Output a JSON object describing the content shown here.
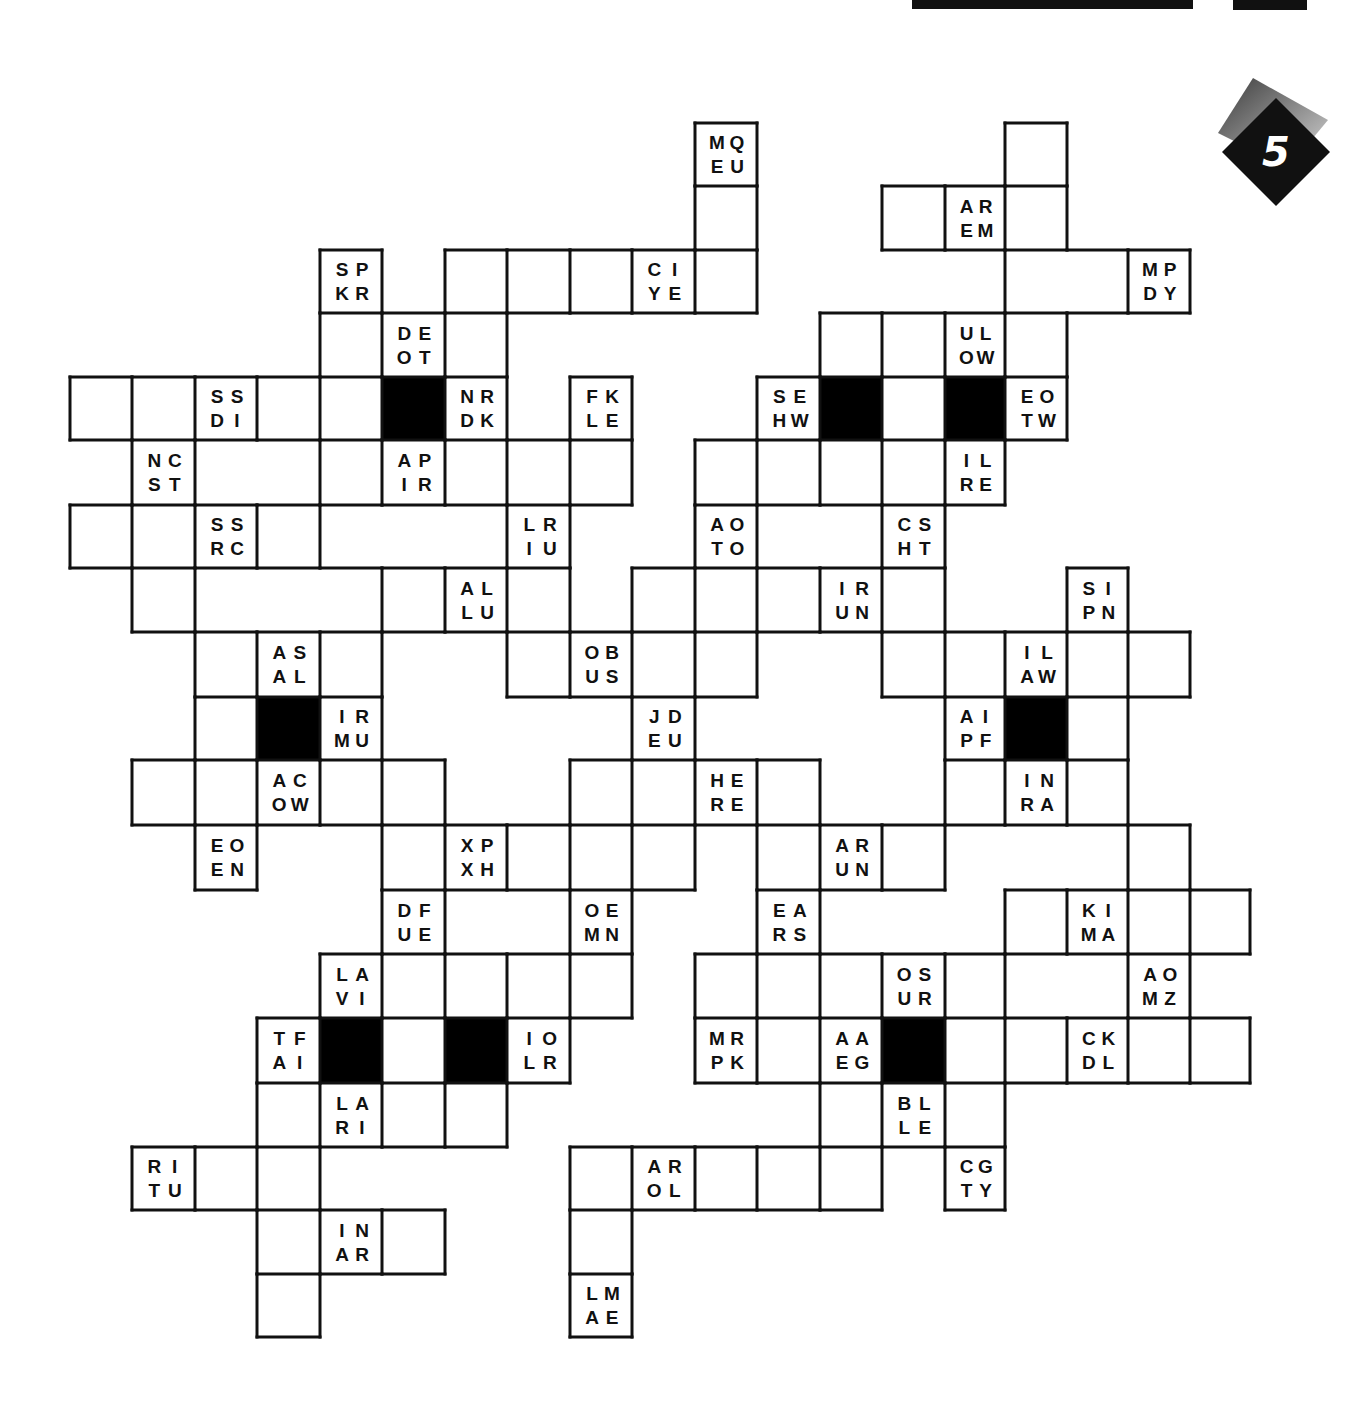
{
  "puzzle": {
    "type": "letter-pair crossword / fill-in grid",
    "badge_number": "5",
    "colors": {
      "ink": "#111111",
      "paper": "#ffffff",
      "badge_dark": "#111111",
      "badge_shadow": "#6d6d6d"
    },
    "lattice": {
      "x": [
        70,
        132,
        195,
        257,
        320,
        382,
        445,
        507,
        570,
        632,
        695,
        757,
        820,
        882,
        945,
        1005,
        1067,
        1128,
        1190,
        1250
      ],
      "y": [
        123,
        186,
        250,
        313,
        377,
        440,
        505,
        568,
        632,
        697,
        760,
        825,
        890,
        954,
        1018,
        1083,
        1147,
        1210,
        1274,
        1337
      ]
    },
    "cells": [
      {
        "r": 0,
        "c": 10,
        "clue": [
          "M",
          "Q",
          "E",
          "U"
        ]
      },
      {
        "r": 0,
        "c": 15
      },
      {
        "r": 1,
        "c": 10
      },
      {
        "r": 1,
        "c": 13
      },
      {
        "r": 1,
        "c": 14,
        "clue": [
          "A",
          "R",
          "E",
          "M"
        ]
      },
      {
        "r": 1,
        "c": 15
      },
      {
        "r": 2,
        "c": 4,
        "clue": [
          "S",
          "P",
          "K",
          "R"
        ]
      },
      {
        "r": 2,
        "c": 6
      },
      {
        "r": 2,
        "c": 7
      },
      {
        "r": 2,
        "c": 8
      },
      {
        "r": 2,
        "c": 9,
        "clue": [
          "C",
          "I",
          "Y",
          "E"
        ]
      },
      {
        "r": 2,
        "c": 10
      },
      {
        "r": 2,
        "c": 15
      },
      {
        "r": 2,
        "c": 16
      },
      {
        "r": 2,
        "c": 17,
        "clue": [
          "M",
          "P",
          "D",
          "Y"
        ]
      },
      {
        "r": 3,
        "c": 4
      },
      {
        "r": 3,
        "c": 5,
        "clue": [
          "D",
          "E",
          "O",
          "T"
        ]
      },
      {
        "r": 3,
        "c": 6
      },
      {
        "r": 3,
        "c": 12
      },
      {
        "r": 3,
        "c": 13
      },
      {
        "r": 3,
        "c": 14,
        "clue": [
          "U",
          "L",
          "O",
          "W"
        ]
      },
      {
        "r": 3,
        "c": 15
      },
      {
        "r": 4,
        "c": 0
      },
      {
        "r": 4,
        "c": 1
      },
      {
        "r": 4,
        "c": 2,
        "clue": [
          "S",
          "S",
          "D",
          "I"
        ]
      },
      {
        "r": 4,
        "c": 3
      },
      {
        "r": 4,
        "c": 4
      },
      {
        "r": 4,
        "c": 5,
        "black": true
      },
      {
        "r": 4,
        "c": 6,
        "clue": [
          "N",
          "R",
          "D",
          "K"
        ]
      },
      {
        "r": 4,
        "c": 7
      },
      {
        "r": 4,
        "c": 8,
        "clue": [
          "F",
          "K",
          "L",
          "E"
        ]
      },
      {
        "r": 4,
        "c": 11,
        "clue": [
          "S",
          "E",
          "H",
          "W"
        ]
      },
      {
        "r": 4,
        "c": 12,
        "black": true
      },
      {
        "r": 4,
        "c": 13
      },
      {
        "r": 4,
        "c": 14,
        "black": true
      },
      {
        "r": 4,
        "c": 15,
        "clue": [
          "E",
          "O",
          "T",
          "W"
        ]
      },
      {
        "r": 5,
        "c": 1,
        "clue": [
          "N",
          "C",
          "S",
          "T"
        ]
      },
      {
        "r": 5,
        "c": 2
      },
      {
        "r": 5,
        "c": 3
      },
      {
        "r": 5,
        "c": 4
      },
      {
        "r": 5,
        "c": 5,
        "clue": [
          "A",
          "P",
          "I",
          "R"
        ]
      },
      {
        "r": 5,
        "c": 6
      },
      {
        "r": 5,
        "c": 7
      },
      {
        "r": 5,
        "c": 8
      },
      {
        "r": 5,
        "c": 10
      },
      {
        "r": 5,
        "c": 11
      },
      {
        "r": 5,
        "c": 12
      },
      {
        "r": 5,
        "c": 13
      },
      {
        "r": 5,
        "c": 14,
        "clue": [
          "I",
          "L",
          "R",
          "E"
        ]
      },
      {
        "r": 6,
        "c": 0
      },
      {
        "r": 6,
        "c": 1
      },
      {
        "r": 6,
        "c": 2,
        "clue": [
          "S",
          "S",
          "R",
          "C"
        ]
      },
      {
        "r": 6,
        "c": 3
      },
      {
        "r": 6,
        "c": 7,
        "clue": [
          "L",
          "R",
          "I",
          "U"
        ]
      },
      {
        "r": 6,
        "c": 10,
        "clue": [
          "A",
          "O",
          "T",
          "O"
        ]
      },
      {
        "r": 6,
        "c": 11
      },
      {
        "r": 6,
        "c": 12
      },
      {
        "r": 6,
        "c": 13,
        "clue": [
          "C",
          "S",
          "H",
          "T"
        ]
      },
      {
        "r": 7,
        "c": 1
      },
      {
        "r": 7,
        "c": 2
      },
      {
        "r": 7,
        "c": 3
      },
      {
        "r": 7,
        "c": 4
      },
      {
        "r": 7,
        "c": 5
      },
      {
        "r": 7,
        "c": 6,
        "clue": [
          "A",
          "L",
          "L",
          "U"
        ]
      },
      {
        "r": 7,
        "c": 7
      },
      {
        "r": 7,
        "c": 9
      },
      {
        "r": 7,
        "c": 10
      },
      {
        "r": 7,
        "c": 11
      },
      {
        "r": 7,
        "c": 12,
        "clue": [
          "I",
          "R",
          "U",
          "N"
        ]
      },
      {
        "r": 7,
        "c": 13
      },
      {
        "r": 7,
        "c": 16,
        "clue": [
          "S",
          "I",
          "P",
          "N"
        ]
      },
      {
        "r": 8,
        "c": 2
      },
      {
        "r": 8,
        "c": 3,
        "clue": [
          "A",
          "S",
          "A",
          "L"
        ]
      },
      {
        "r": 8,
        "c": 4
      },
      {
        "r": 8,
        "c": 7
      },
      {
        "r": 8,
        "c": 8,
        "clue": [
          "O",
          "B",
          "U",
          "S"
        ]
      },
      {
        "r": 8,
        "c": 9
      },
      {
        "r": 8,
        "c": 10
      },
      {
        "r": 8,
        "c": 13
      },
      {
        "r": 8,
        "c": 14
      },
      {
        "r": 8,
        "c": 15,
        "clue": [
          "I",
          "L",
          "A",
          "W"
        ]
      },
      {
        "r": 8,
        "c": 16
      },
      {
        "r": 8,
        "c": 17
      },
      {
        "r": 9,
        "c": 2
      },
      {
        "r": 9,
        "c": 3,
        "black": true
      },
      {
        "r": 9,
        "c": 4,
        "clue": [
          "I",
          "R",
          "M",
          "U"
        ]
      },
      {
        "r": 9,
        "c": 9,
        "clue": [
          "J",
          "D",
          "E",
          "U"
        ]
      },
      {
        "r": 9,
        "c": 14,
        "clue": [
          "A",
          "I",
          "P",
          "F"
        ]
      },
      {
        "r": 9,
        "c": 15,
        "black": true
      },
      {
        "r": 9,
        "c": 16
      },
      {
        "r": 10,
        "c": 1
      },
      {
        "r": 10,
        "c": 2
      },
      {
        "r": 10,
        "c": 3,
        "clue": [
          "A",
          "C",
          "O",
          "W"
        ]
      },
      {
        "r": 10,
        "c": 4
      },
      {
        "r": 10,
        "c": 5
      },
      {
        "r": 10,
        "c": 8
      },
      {
        "r": 10,
        "c": 9
      },
      {
        "r": 10,
        "c": 10,
        "clue": [
          "H",
          "E",
          "R",
          "E"
        ]
      },
      {
        "r": 10,
        "c": 11
      },
      {
        "r": 10,
        "c": 14
      },
      {
        "r": 10,
        "c": 15,
        "clue": [
          "I",
          "N",
          "R",
          "A"
        ]
      },
      {
        "r": 10,
        "c": 16
      },
      {
        "r": 11,
        "c": 2,
        "clue": [
          "E",
          "O",
          "E",
          "N"
        ]
      },
      {
        "r": 11,
        "c": 5
      },
      {
        "r": 11,
        "c": 6,
        "clue": [
          "X",
          "P",
          "X",
          "H"
        ]
      },
      {
        "r": 11,
        "c": 7
      },
      {
        "r": 11,
        "c": 8
      },
      {
        "r": 11,
        "c": 9
      },
      {
        "r": 11,
        "c": 11
      },
      {
        "r": 11,
        "c": 12,
        "clue": [
          "A",
          "R",
          "U",
          "N"
        ]
      },
      {
        "r": 11,
        "c": 13
      },
      {
        "r": 11,
        "c": 14
      },
      {
        "r": 11,
        "c": 15
      },
      {
        "r": 11,
        "c": 16
      },
      {
        "r": 11,
        "c": 17
      },
      {
        "r": 12,
        "c": 5,
        "clue": [
          "D",
          "F",
          "U",
          "E"
        ]
      },
      {
        "r": 12,
        "c": 6
      },
      {
        "r": 12,
        "c": 7
      },
      {
        "r": 12,
        "c": 8,
        "clue": [
          "O",
          "E",
          "M",
          "N"
        ]
      },
      {
        "r": 12,
        "c": 11,
        "clue": [
          "E",
          "A",
          "R",
          "S"
        ]
      },
      {
        "r": 12,
        "c": 15
      },
      {
        "r": 12,
        "c": 16,
        "clue": [
          "K",
          "I",
          "M",
          "A"
        ]
      },
      {
        "r": 12,
        "c": 17
      },
      {
        "r": 12,
        "c": 18
      },
      {
        "r": 13,
        "c": 4,
        "clue": [
          "L",
          "A",
          "V",
          "I"
        ]
      },
      {
        "r": 13,
        "c": 5
      },
      {
        "r": 13,
        "c": 6
      },
      {
        "r": 13,
        "c": 7
      },
      {
        "r": 13,
        "c": 8
      },
      {
        "r": 13,
        "c": 10
      },
      {
        "r": 13,
        "c": 11
      },
      {
        "r": 13,
        "c": 12
      },
      {
        "r": 13,
        "c": 13,
        "clue": [
          "O",
          "S",
          "U",
          "R"
        ]
      },
      {
        "r": 13,
        "c": 14
      },
      {
        "r": 13,
        "c": 15
      },
      {
        "r": 13,
        "c": 16
      },
      {
        "r": 13,
        "c": 17,
        "clue": [
          "A",
          "O",
          "M",
          "Z"
        ]
      },
      {
        "r": 14,
        "c": 3,
        "clue": [
          "T",
          "F",
          "A",
          "I"
        ]
      },
      {
        "r": 14,
        "c": 4,
        "black": true
      },
      {
        "r": 14,
        "c": 5
      },
      {
        "r": 14,
        "c": 6,
        "black": true
      },
      {
        "r": 14,
        "c": 7,
        "clue": [
          "I",
          "O",
          "L",
          "R"
        ]
      },
      {
        "r": 14,
        "c": 10,
        "clue": [
          "M",
          "R",
          "P",
          "K"
        ]
      },
      {
        "r": 14,
        "c": 11
      },
      {
        "r": 14,
        "c": 12,
        "clue": [
          "A",
          "A",
          "E",
          "G"
        ]
      },
      {
        "r": 14,
        "c": 13,
        "black": true
      },
      {
        "r": 14,
        "c": 14
      },
      {
        "r": 14,
        "c": 15
      },
      {
        "r": 14,
        "c": 16,
        "clue": [
          "C",
          "K",
          "D",
          "L"
        ]
      },
      {
        "r": 14,
        "c": 17
      },
      {
        "r": 14,
        "c": 18
      },
      {
        "r": 15,
        "c": 3
      },
      {
        "r": 15,
        "c": 4,
        "clue": [
          "L",
          "A",
          "R",
          "I"
        ]
      },
      {
        "r": 15,
        "c": 5
      },
      {
        "r": 15,
        "c": 6
      },
      {
        "r": 15,
        "c": 12
      },
      {
        "r": 15,
        "c": 13,
        "clue": [
          "B",
          "L",
          "L",
          "E"
        ]
      },
      {
        "r": 15,
        "c": 14
      },
      {
        "r": 16,
        "c": 1,
        "clue": [
          "R",
          "I",
          "T",
          "U"
        ]
      },
      {
        "r": 16,
        "c": 2
      },
      {
        "r": 16,
        "c": 3
      },
      {
        "r": 16,
        "c": 8
      },
      {
        "r": 16,
        "c": 9,
        "clue": [
          "A",
          "R",
          "O",
          "L"
        ]
      },
      {
        "r": 16,
        "c": 10
      },
      {
        "r": 16,
        "c": 11
      },
      {
        "r": 16,
        "c": 12
      },
      {
        "r": 16,
        "c": 14,
        "clue": [
          "C",
          "G",
          "T",
          "Y"
        ]
      },
      {
        "r": 17,
        "c": 3
      },
      {
        "r": 17,
        "c": 4,
        "clue": [
          "I",
          "N",
          "A",
          "R"
        ]
      },
      {
        "r": 17,
        "c": 5
      },
      {
        "r": 17,
        "c": 8
      },
      {
        "r": 18,
        "c": 3
      },
      {
        "r": 18,
        "c": 8,
        "clue": [
          "L",
          "M",
          "A",
          "E"
        ]
      }
    ],
    "open_edges": [
      {
        "r": 5,
        "c": 2,
        "side": "right"
      },
      {
        "r": 7,
        "c": 2,
        "side": "right"
      },
      {
        "r": 7,
        "c": 3,
        "side": "right"
      },
      {
        "r": 6,
        "c": 11,
        "side": "right"
      },
      {
        "r": 2,
        "c": 15,
        "side": "right"
      },
      {
        "r": 12,
        "c": 6,
        "side": "right"
      },
      {
        "r": 13,
        "c": 15,
        "side": "right"
      },
      {
        "r": 11,
        "c": 14,
        "side": "right"
      },
      {
        "r": 11,
        "c": 15,
        "side": "right"
      },
      {
        "r": 11,
        "c": 14,
        "side": "bottom"
      },
      {
        "r": 4,
        "c": 7,
        "side": "top"
      }
    ]
  }
}
